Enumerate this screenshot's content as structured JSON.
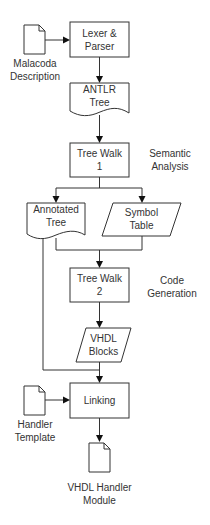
{
  "diagram": {
    "type": "flowchart",
    "nodes": {
      "malacoda_description": {
        "shape": "document-icon",
        "line1": "Malacoda",
        "line2": "Description"
      },
      "lexer_parser": {
        "shape": "process",
        "line1": "Lexer &",
        "line2": "Parser"
      },
      "antlr_tree": {
        "shape": "document",
        "line1": "ANTLR",
        "line2": "Tree"
      },
      "tree_walk_1": {
        "shape": "process",
        "line1": "Tree Walk",
        "line2": "1"
      },
      "annotated_tree": {
        "shape": "document",
        "line1": "Annotated",
        "line2": "Tree"
      },
      "symbol_table": {
        "shape": "data",
        "line1": "Symbol",
        "line2": "Table"
      },
      "tree_walk_2": {
        "shape": "process",
        "line1": "Tree Walk",
        "line2": "2"
      },
      "vhdl_blocks": {
        "shape": "data",
        "line1": "VHDL",
        "line2": "Blocks"
      },
      "linking": {
        "shape": "process",
        "line1": "Linking"
      },
      "handler_template": {
        "shape": "document-icon",
        "line1": "Handler",
        "line2": "Template"
      },
      "vhdl_handler_module": {
        "shape": "document-icon",
        "line1": "VHDL Handler",
        "line2": "Module"
      }
    },
    "annotations": {
      "semantic_analysis": {
        "line1": "Semantic",
        "line2": "Analysis"
      },
      "code_generation": {
        "line1": "Code",
        "line2": "Generation"
      }
    },
    "edges": [
      {
        "from": "Malacoda Description",
        "to": "Lexer & Parser"
      },
      {
        "from": "Lexer & Parser",
        "to": "ANTLR Tree"
      },
      {
        "from": "ANTLR Tree",
        "to": "Tree Walk 1"
      },
      {
        "from": "Tree Walk 1",
        "to": "Annotated Tree"
      },
      {
        "from": "Tree Walk 1",
        "to": "Symbol Table"
      },
      {
        "from": "Annotated Tree",
        "to": "Tree Walk 2"
      },
      {
        "from": "Symbol Table",
        "to": "Tree Walk 2"
      },
      {
        "from": "Tree Walk 2",
        "to": "VHDL Blocks"
      },
      {
        "from": "Annotated Tree",
        "to": "Linking"
      },
      {
        "from": "VHDL Blocks",
        "to": "Linking"
      },
      {
        "from": "Handler Template",
        "to": "Linking"
      },
      {
        "from": "Linking",
        "to": "VHDL Handler Module"
      }
    ]
  }
}
